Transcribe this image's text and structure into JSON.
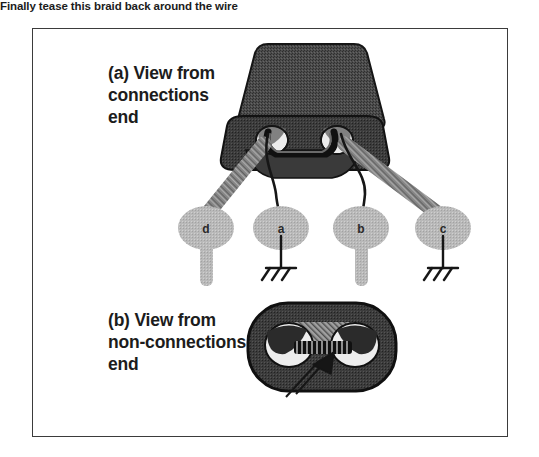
{
  "figure": {
    "border_color": "#3b3b3b",
    "background_color": "#ffffff"
  },
  "views": [
    {
      "id": "view-a",
      "label_line_1": "(a) View from",
      "label_line_2": "connections",
      "label_line_3": "end"
    },
    {
      "id": "view-b",
      "label_line_1": "(b) View from",
      "label_line_2": "non-connections",
      "label_line_3": "end"
    }
  ],
  "terminals": [
    {
      "id": "terminal-d",
      "letter": "d",
      "connection": "braid",
      "has_tab": true,
      "has_ground": false,
      "cx": 206,
      "cy": 228
    },
    {
      "id": "terminal-a",
      "letter": "a",
      "connection": "wire",
      "has_tab": false,
      "has_ground": true,
      "cx": 281,
      "cy": 228
    },
    {
      "id": "terminal-b",
      "letter": "b",
      "connection": "wire",
      "has_tab": true,
      "has_ground": false,
      "cx": 361,
      "cy": 228
    },
    {
      "id": "terminal-c",
      "letter": "c",
      "connection": "braid",
      "has_tab": false,
      "has_ground": true,
      "cx": 443,
      "cy": 228
    }
  ],
  "annotation": {
    "braid_note": "Finally tease this braid back around the wire",
    "arrow": "callout-arrow pointing to braid"
  },
  "colors": {
    "core_dark": "#4a4a4a",
    "core_shade": "#5a5a5a",
    "core_outline": "#141414",
    "hole_light": "#e8e8e8",
    "terminal_gray": "#b4b4b4",
    "braid_gray": "#8a8a8a",
    "wire_black": "#1a1a1a",
    "text": "#1c1c1c"
  }
}
